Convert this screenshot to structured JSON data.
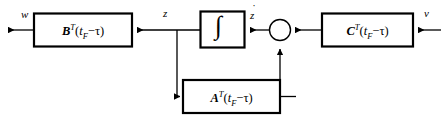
{
  "diagram": {
    "background_color": "#ffffff",
    "line_color": "#000000",
    "box_border_color": "#000000",
    "box_fill_color": "#ffffff"
  },
  "blocks": {
    "b_block": {
      "matrix": "B",
      "transpose": "T",
      "arg_open": "(",
      "arg_var": "t",
      "arg_sub": "F",
      "arg_op": "−",
      "arg_tau": "τ",
      "arg_close": ")"
    },
    "integrator": {
      "glyph": "∫",
      "name": "integrator"
    },
    "a_block": {
      "matrix": "A",
      "transpose": "T",
      "arg_open": "(",
      "arg_var": "t",
      "arg_sub": "F",
      "arg_op": "−",
      "arg_tau": "τ",
      "arg_close": ")"
    },
    "c_block": {
      "matrix": "C",
      "transpose": "T",
      "arg_open": "(",
      "arg_var": "t",
      "arg_sub": "F",
      "arg_op": "−",
      "arg_tau": "τ",
      "arg_close": ")"
    }
  },
  "signals": {
    "output_w": "w",
    "state_z": "z",
    "state_zdot": "z",
    "state_zdot_accent": "̇",
    "input_v": "v"
  },
  "junction": {
    "name": "summing-junction",
    "shape": "circle"
  }
}
